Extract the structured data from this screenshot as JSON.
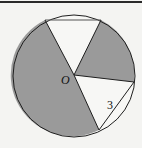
{
  "diagram": {
    "type": "geometry-circle-sectors",
    "center_label": "O",
    "chord_label": "3",
    "colors": {
      "shaded": "#9a9a9a",
      "unshaded": "#f7f7f5",
      "stroke": "#1e1e1e",
      "background": "#f4f4f2"
    },
    "circle": {
      "cx": 74,
      "cy": 76,
      "r": 61
    },
    "points": {
      "O": [
        74,
        75
      ],
      "A": [
        45,
        20
      ],
      "B": [
        101,
        20
      ],
      "C": [
        134,
        82
      ],
      "D": [
        99,
        130
      ]
    }
  }
}
